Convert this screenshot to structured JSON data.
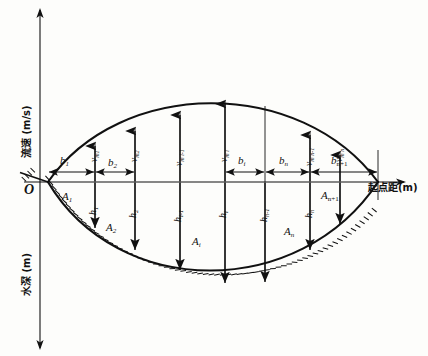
{
  "figure": {
    "domain": "hydrological-cross-section-diagram",
    "background_color": "#fdfdfb",
    "ink_color": "#111111"
  },
  "axes": {
    "vertical_up_label": "流速 (m/s)",
    "vertical_down_label": "水深 (m)",
    "horizontal_label": "起点距(m)",
    "origin_label": "O"
  },
  "widths": {
    "note": "segment width labels along the horizontal axis",
    "items": [
      {
        "id": "b1",
        "base": "b",
        "sub": "1"
      },
      {
        "id": "b2",
        "base": "b",
        "sub": "2"
      },
      {
        "id": "bi",
        "base": "b",
        "sub": "i"
      },
      {
        "id": "bn",
        "base": "b",
        "sub": "n"
      },
      {
        "id": "bn1",
        "base": "b",
        "sub": "n+1"
      }
    ]
  },
  "velocities": {
    "note": "mean vertical velocities, drawn as upward arrows, labels rotated 90 degrees",
    "items": [
      {
        "id": "vm1",
        "base": "v",
        "sub": "m1"
      },
      {
        "id": "vm2",
        "base": "v",
        "sub": "m2"
      },
      {
        "id": "vmi_1",
        "base": "v",
        "sub": "m i-1"
      },
      {
        "id": "vmi",
        "base": "v",
        "sub": "m i"
      },
      {
        "id": "vmn_1",
        "base": "v",
        "sub": "m n-1"
      },
      {
        "id": "vmn",
        "base": "v",
        "sub": "m n"
      }
    ]
  },
  "depths": {
    "note": "water depths at each measuring vertical, drawn as downward arrows, labels rotated 90 degrees",
    "items": [
      {
        "id": "h1",
        "base": "h",
        "sub": "1"
      },
      {
        "id": "h2",
        "base": "h",
        "sub": "2"
      },
      {
        "id": "hi_1",
        "base": "h",
        "sub": "i-1"
      },
      {
        "id": "hi",
        "base": "h",
        "sub": "i"
      },
      {
        "id": "hn_1",
        "base": "h",
        "sub": "n-1"
      },
      {
        "id": "hn",
        "base": "h",
        "sub": "n"
      }
    ]
  },
  "areas": {
    "note": "partial cross-section areas between verticals",
    "items": [
      {
        "id": "A1",
        "base": "A",
        "sub": "1"
      },
      {
        "id": "A2",
        "base": "A",
        "sub": "2"
      },
      {
        "id": "Ai",
        "base": "A",
        "sub": "i"
      },
      {
        "id": "An",
        "base": "A",
        "sub": "n"
      },
      {
        "id": "An1",
        "base": "A",
        "sub": "n+1"
      }
    ]
  },
  "geometry": {
    "note": "pixel coordinates used by the drawing layer",
    "axis_x": 40,
    "axis_y": 182,
    "axis_top": 10,
    "axis_bottom": 348,
    "axis_right": 400,
    "water_left_x": 48,
    "water_right_x": 378,
    "verticals_x": [
      95,
      135,
      180,
      225,
      265,
      310,
      340
    ],
    "velocity_peak_y": 93,
    "bed_max_y": 288
  }
}
